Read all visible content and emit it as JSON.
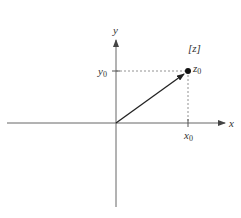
{
  "diagram": {
    "title": "",
    "plane_label": "[z]",
    "axes": {
      "x_label": "x",
      "y_label": "y"
    },
    "point": {
      "label": "z",
      "subscript": "0",
      "x_tick_label": "x",
      "x_tick_sub": "0",
      "y_tick_label": "y",
      "y_tick_sub": "0"
    },
    "colors": {
      "axis": "#555555",
      "vector": "#222222",
      "dashed": "#666666",
      "text": "#333333"
    }
  }
}
